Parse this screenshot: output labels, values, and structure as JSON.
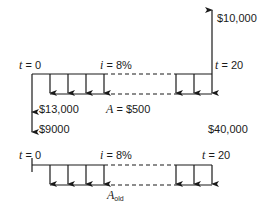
{
  "top_diagram": {
    "t_start": {
      "var": "t",
      "eq": " = 0"
    },
    "t_end": {
      "var": "t",
      "eq": " = 20"
    },
    "interest": {
      "var": "i",
      "eq": " = 8%"
    },
    "annuity": {
      "var": "A",
      "eq": " = $500"
    },
    "inflow_final": "$10,000",
    "outflow_1": "$13,000",
    "outflow_2": "$9000"
  },
  "middle_label": "$40,000",
  "bottom_diagram": {
    "t_start": {
      "var": "t",
      "eq": " = 0"
    },
    "t_end": {
      "var": "t",
      "eq": " = 20"
    },
    "interest": {
      "var": "i",
      "eq": " = 8%"
    },
    "annuity": {
      "var": "A",
      "sub": "old"
    }
  }
}
